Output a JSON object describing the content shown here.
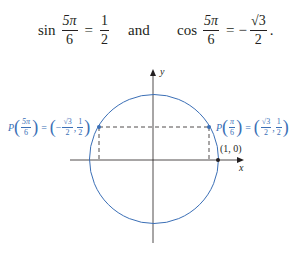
{
  "equations": {
    "sin": {
      "fn": "sin",
      "num": "5π",
      "den": "6",
      "eq": "=",
      "rhs_num": "1",
      "rhs_den": "2"
    },
    "connector": "and",
    "cos": {
      "fn": "cos",
      "num": "5π",
      "den": "6",
      "eq": "=",
      "sign": "−",
      "rhs_num": "√3",
      "rhs_den": "2",
      "end": "."
    }
  },
  "figure": {
    "y_axis_label": "y",
    "x_axis_label": "x",
    "point_1_0_label": "(1, 0)",
    "left_point": {
      "P": "P",
      "arg_num": "5π",
      "arg_den": "6",
      "eq": "=",
      "sign": "−",
      "x_num": "√3",
      "x_den": "2",
      "y_num": "1",
      "y_den": "2"
    },
    "right_point": {
      "P": "P",
      "arg_num": "π",
      "arg_den": "6",
      "eq": "=",
      "x_num": "√3",
      "x_den": "2",
      "y_num": "1",
      "y_den": "2"
    },
    "colors": {
      "circle": "#3b6fb6",
      "axis": "#231f20",
      "label": "#3b6fb6"
    }
  }
}
